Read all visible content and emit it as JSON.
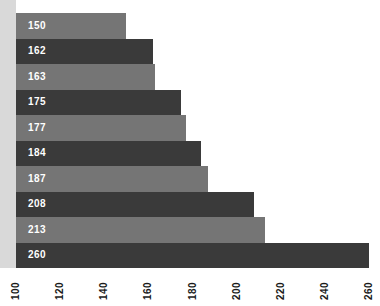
{
  "chart_data": {
    "type": "bar",
    "orientation": "horizontal",
    "title": "",
    "subtitle": "",
    "xlabel": "",
    "ylabel": "",
    "categories": [
      "",
      "",
      "",
      "",
      "",
      "",
      "",
      "",
      "",
      ""
    ],
    "values": [
      150,
      162,
      163,
      175,
      177,
      184,
      187,
      208,
      213,
      260
    ],
    "data_labels": [
      "150",
      "162",
      "163",
      "175",
      "177",
      "184",
      "187",
      "208",
      "213",
      "260"
    ],
    "bar_styles": [
      "light",
      "dark",
      "light",
      "dark",
      "light",
      "dark",
      "light",
      "dark",
      "light",
      "dark"
    ],
    "xlim": [
      100,
      260
    ],
    "ylim": null,
    "x_ticks": [
      100,
      120,
      140,
      160,
      180,
      200,
      220,
      240,
      260
    ],
    "x_tick_labels": [
      "100",
      "120",
      "140",
      "160",
      "180",
      "200",
      "220",
      "240",
      "260"
    ],
    "x_tick_rotation": 90,
    "grid": false,
    "legend": null,
    "legend_position": "none",
    "annotations": [],
    "colors": {
      "bar_light": "#757575",
      "bar_dark": "#3a3a3a",
      "data_label": "#ffffff",
      "tick_label": "#1a1a1a",
      "background": "#ffffff",
      "left_margin_band": "#d9d9d9"
    }
  }
}
